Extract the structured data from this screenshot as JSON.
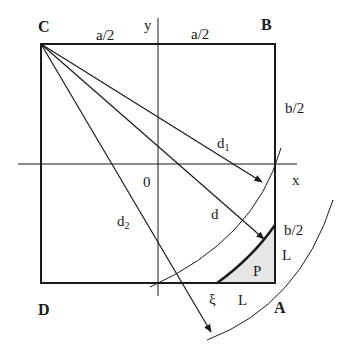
{
  "diagram": {
    "corners": {
      "C": "C",
      "B": "B",
      "A": "A",
      "D": "D"
    },
    "axes": {
      "x_label": "x",
      "y_label": "y",
      "origin_label": "0"
    },
    "dimensions": {
      "top_left": "a/2",
      "top_right": "a/2",
      "right_upper": "b/2",
      "right_lower": "b/2"
    },
    "distances": {
      "d1_main": "d",
      "d1_sub": "1",
      "d": "d",
      "d2_main": "d",
      "d2_sub": "2"
    },
    "region": {
      "P": "P",
      "L_vertical": "L",
      "L_horizontal": "L",
      "xi": "ξ"
    },
    "colors": {
      "stroke": "#1a1a1a",
      "region_fill": "#e6e6e6",
      "background": "#ffffff"
    }
  }
}
